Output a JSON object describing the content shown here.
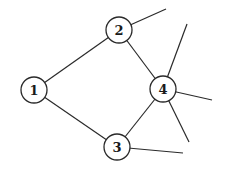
{
  "diagram": {
    "type": "graph",
    "nodes": [
      {
        "id": "1",
        "label": "1",
        "x": 34,
        "y": 90,
        "r": 13
      },
      {
        "id": "2",
        "label": "2",
        "x": 119,
        "y": 30,
        "r": 13
      },
      {
        "id": "3",
        "label": "3",
        "x": 117,
        "y": 147,
        "r": 13
      },
      {
        "id": "4",
        "label": "4",
        "x": 163,
        "y": 89,
        "r": 13
      }
    ],
    "edges": [
      {
        "from": "1",
        "to": "2"
      },
      {
        "from": "1",
        "to": "3"
      },
      {
        "from": "2",
        "to": "4"
      },
      {
        "from": "3",
        "to": "4"
      }
    ],
    "dangling_edges": [
      {
        "from": "2",
        "to_point": [
          166,
          9
        ]
      },
      {
        "from": "4",
        "to_point": [
          187,
          24
        ]
      },
      {
        "from": "4",
        "to_point": [
          212,
          100
        ]
      },
      {
        "from": "4",
        "to_point": [
          189,
          142
        ]
      },
      {
        "from": "3",
        "to_point": [
          183,
          153
        ]
      }
    ]
  }
}
